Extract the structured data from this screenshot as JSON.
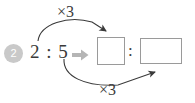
{
  "problem": {
    "number": "2",
    "ratio_text": "2 : 5",
    "ratio_left": "2",
    "ratio_separator": ":",
    "ratio_right": "5",
    "implies_icon": "right-arrow-icon",
    "answer_separator": ":",
    "answer_boxes": [
      {
        "value": "",
        "placeholder": ""
      },
      {
        "value": "",
        "placeholder": ""
      }
    ],
    "multiplier_top": "×3",
    "multiplier_bottom": "×3"
  },
  "colors": {
    "background": "#ffffff",
    "text": "#3a3a3a",
    "badge_fill": "#c9c9c9",
    "badge_text": "#ffffff",
    "box_border": "#9a9a9a",
    "arrow_stroke": "#3a3a3a",
    "implies_arrow": "#b5b5b5"
  }
}
